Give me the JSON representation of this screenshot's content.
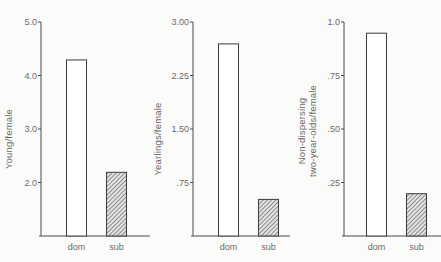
{
  "chart_data": [
    {
      "type": "bar",
      "title": "",
      "xlabel": "",
      "ylabel": "Young/female",
      "categories": [
        "dom",
        "sub"
      ],
      "values": [
        4.3,
        2.2
      ],
      "ylim": [
        1.0,
        5.0
      ],
      "yticks": [
        2.0,
        3.0,
        4.0,
        5.0
      ],
      "ytick_labels": [
        "2.0",
        "3.0",
        "4.0",
        "5.0"
      ],
      "bar_styles": [
        "open",
        "hatched"
      ],
      "grid": false
    },
    {
      "type": "bar",
      "title": "",
      "xlabel": "",
      "ylabel": "Yearlings/female",
      "categories": [
        "dom",
        "sub"
      ],
      "values": [
        2.7,
        0.52
      ],
      "ylim": [
        0,
        3.0
      ],
      "yticks": [
        0.75,
        1.5,
        2.25,
        3.0
      ],
      "ytick_labels": [
        ".75",
        "1.50",
        "2.25",
        "3.00"
      ],
      "bar_styles": [
        "open",
        "hatched"
      ],
      "grid": false
    },
    {
      "type": "bar",
      "title": "",
      "xlabel": "",
      "ylabel": "Non-dispersing two-year-olds/female",
      "ylabel_lines": [
        "Non-dispersing",
        "two-year-olds/female"
      ],
      "categories": [
        "dom",
        "sub"
      ],
      "values": [
        0.95,
        0.2
      ],
      "ylim": [
        0,
        1.0
      ],
      "yticks": [
        0.25,
        0.5,
        0.75,
        1.0
      ],
      "ytick_labels": [
        ".25",
        ".50",
        ".75",
        "1.0"
      ],
      "bar_styles": [
        "open",
        "hatched"
      ],
      "grid": false
    }
  ],
  "colors": {
    "axis": "#4a4a4a",
    "bar_fill_open": "#ffffff",
    "bar_edge": "#3c3c3c",
    "hatch": "#555555",
    "background": "#fbfbfa"
  }
}
